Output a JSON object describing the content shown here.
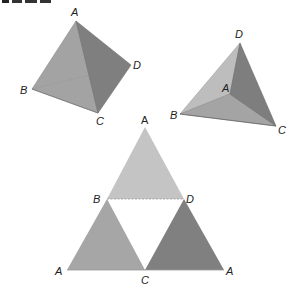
{
  "header": {
    "cropped_title_visible": true
  },
  "figures": {
    "tetra_left": {
      "labels": {
        "A": "A",
        "B": "B",
        "C": "C",
        "D": "D"
      },
      "colors": {
        "front": "#a3a3a3",
        "right": "#7f7f7f"
      }
    },
    "tetra_right": {
      "labels": {
        "A": "A",
        "B": "B",
        "C": "C",
        "D": "D"
      },
      "colors": {
        "left": "#bdbdbd",
        "bottom": "#a4a4a4",
        "right": "#7e7e7e"
      }
    },
    "net": {
      "labels": {
        "top_A": "A",
        "B": "B",
        "D": "D",
        "left_A": "A",
        "C": "C",
        "right_A": "A"
      },
      "colors": {
        "top": "#c4c4c4",
        "left": "#a6a6a6",
        "right": "#808080"
      }
    }
  }
}
